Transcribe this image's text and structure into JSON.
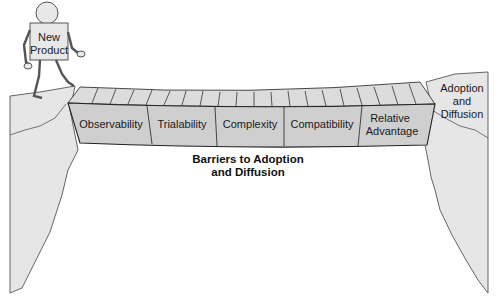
{
  "figure": {
    "character": {
      "label_line1": "New",
      "label_line2": "Product"
    },
    "destination": {
      "label_line1": "Adoption",
      "label_line2": "and",
      "label_line3": "Diffusion"
    },
    "bridge": {
      "segments": [
        {
          "label_line1": "Observability",
          "label_line2": ""
        },
        {
          "label_line1": "Trialability",
          "label_line2": ""
        },
        {
          "label_line1": "Complexity",
          "label_line2": ""
        },
        {
          "label_line1": "Compatibility",
          "label_line2": ""
        },
        {
          "label_line1": "Relative",
          "label_line2": "Advantage"
        }
      ]
    },
    "caption": {
      "line1": "Barriers to Adoption",
      "line2": "and Diffusion"
    },
    "colors": {
      "cliff_fill": "#e6e6e6",
      "bridge_top": "#dcdcdc",
      "bridge_side": "#cfcfcf",
      "outline": "#3a3a3a"
    }
  }
}
